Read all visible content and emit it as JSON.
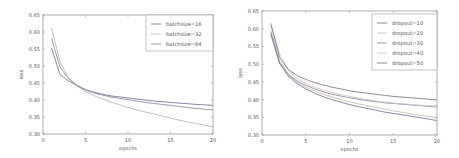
{
  "chart_data": [
    {
      "type": "line",
      "title": "",
      "xlabel": "epochs",
      "ylabel": "loss",
      "xlim": [
        0,
        20
      ],
      "ylim": [
        0.3,
        0.65
      ],
      "xticks": [
        0,
        5,
        10,
        15,
        20
      ],
      "yticks": [
        0.3,
        0.35,
        0.4,
        0.45,
        0.5,
        0.55,
        0.6,
        0.65
      ],
      "ytick_labels": [
        "0.30",
        "0.35",
        "0.40",
        "0.45",
        "0.50",
        "0.55",
        "0.60",
        "0.65"
      ],
      "grid": false,
      "legend_position": "upper right",
      "x": [
        1,
        2,
        3,
        4,
        5,
        6,
        7,
        8,
        9,
        10,
        11,
        12,
        13,
        14,
        15,
        16,
        17,
        18,
        19,
        20
      ],
      "series": [
        {
          "name": "batchsize=16",
          "color": "#6a6a8a",
          "values": [
            0.553,
            0.475,
            0.456,
            0.443,
            0.43,
            0.423,
            0.417,
            0.412,
            0.409,
            0.406,
            0.403,
            0.4,
            0.397,
            0.395,
            0.393,
            0.391,
            0.389,
            0.387,
            0.386,
            0.384
          ]
        },
        {
          "name": "batchsize=32",
          "color": "#b0b0b0",
          "values": [
            0.612,
            0.513,
            0.465,
            0.441,
            0.425,
            0.413,
            0.403,
            0.394,
            0.386,
            0.378,
            0.371,
            0.365,
            0.359,
            0.353,
            0.347,
            0.341,
            0.336,
            0.331,
            0.326,
            0.321
          ]
        },
        {
          "name": "batchsize=64",
          "color": "#8a7a9a",
          "values": [
            0.582,
            0.497,
            0.463,
            0.443,
            0.43,
            0.421,
            0.414,
            0.409,
            0.405,
            0.401,
            0.397,
            0.393,
            0.39,
            0.387,
            0.384,
            0.381,
            0.378,
            0.375,
            0.373,
            0.371
          ]
        }
      ]
    },
    {
      "type": "line",
      "title": "",
      "xlabel": "epochs",
      "ylabel": "loss",
      "xlim": [
        0,
        20
      ],
      "ylim": [
        0.3,
        0.65
      ],
      "xticks": [
        0,
        5,
        10,
        15,
        20
      ],
      "yticks": [
        0.3,
        0.35,
        0.4,
        0.45,
        0.5,
        0.55,
        0.6,
        0.65
      ],
      "ytick_labels": [
        "0.30",
        "0.35",
        "0.40",
        "0.45",
        "0.50",
        "0.55",
        "0.60",
        "0.65"
      ],
      "grid": false,
      "legend_position": "upper right",
      "x": [
        1,
        2,
        3,
        4,
        5,
        6,
        7,
        8,
        9,
        10,
        11,
        12,
        13,
        14,
        15,
        16,
        17,
        18,
        19,
        20
      ],
      "series": [
        {
          "name": "dropout=10",
          "color": "#6a6a8a",
          "values": [
            0.585,
            0.502,
            0.466,
            0.445,
            0.43,
            0.418,
            0.408,
            0.4,
            0.393,
            0.386,
            0.38,
            0.375,
            0.37,
            0.365,
            0.361,
            0.357,
            0.353,
            0.349,
            0.345,
            0.341
          ]
        },
        {
          "name": "dropout=20",
          "color": "#c8b8a8",
          "values": [
            0.595,
            0.51,
            0.472,
            0.45,
            0.435,
            0.424,
            0.415,
            0.407,
            0.4,
            0.394,
            0.388,
            0.383,
            0.378,
            0.373,
            0.368,
            0.364,
            0.36,
            0.356,
            0.352,
            0.349
          ]
        },
        {
          "name": "dropout=30",
          "color": "#8a7a9a",
          "values": [
            0.59,
            0.505,
            0.47,
            0.452,
            0.44,
            0.43,
            0.422,
            0.415,
            0.41,
            0.405,
            0.401,
            0.397,
            0.394,
            0.391,
            0.389,
            0.387,
            0.385,
            0.383,
            0.381,
            0.379
          ]
        },
        {
          "name": "dropout=40",
          "color": "#c8c0c8",
          "values": [
            0.61,
            0.53,
            0.483,
            0.458,
            0.445,
            0.435,
            0.427,
            0.42,
            0.414,
            0.409,
            0.404,
            0.4,
            0.396,
            0.393,
            0.39,
            0.388,
            0.386,
            0.384,
            0.383,
            0.382
          ]
        },
        {
          "name": "dropout=50",
          "color": "#7a6a7a",
          "values": [
            0.615,
            0.52,
            0.485,
            0.468,
            0.457,
            0.448,
            0.441,
            0.435,
            0.43,
            0.425,
            0.421,
            0.418,
            0.415,
            0.412,
            0.409,
            0.407,
            0.405,
            0.403,
            0.401,
            0.399
          ]
        }
      ]
    }
  ]
}
